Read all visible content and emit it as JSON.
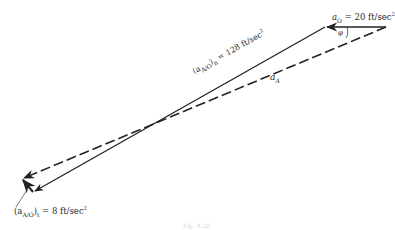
{
  "diagram": {
    "type": "acceleration-vector-polygon",
    "vectors": [
      {
        "id": "a_O",
        "label_symbol": "a",
        "label_sub": "O",
        "label_value": " = 20 ft/sec",
        "label_sup": "2",
        "style": "solid",
        "direction": "left"
      },
      {
        "id": "a_AO_n",
        "label_prefix": "(a",
        "label_sub": "A/O",
        "label_suffix": ")",
        "label_sub2": "n",
        "label_value": " = 128 ft/sec",
        "label_sup": "2",
        "style": "solid",
        "direction": "down-left"
      },
      {
        "id": "a_AO_t",
        "label_prefix": "(a",
        "label_sub": "A/O",
        "label_suffix": ")",
        "label_sub2": "t",
        "label_value": " = 8 ft/sec",
        "label_sup": "2",
        "style": "solid",
        "direction": "up-left"
      },
      {
        "id": "a_A",
        "label_symbol": "a",
        "label_sub": "A",
        "style": "dashed",
        "direction": "down-left"
      }
    ],
    "angle_label": "φ",
    "caption": "Fig. 4.28"
  }
}
